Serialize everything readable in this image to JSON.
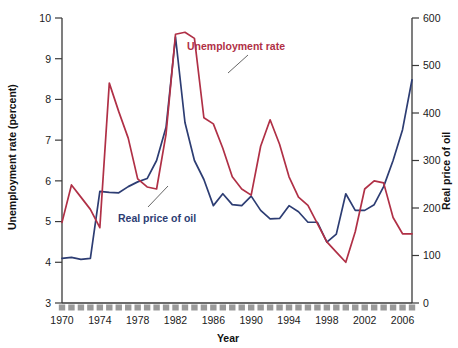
{
  "chart_data": {
    "type": "line",
    "title": "",
    "xlabel": "Year",
    "ylabel": "Unemployment rate (percent)",
    "y2label": "Real price of oil",
    "ylim": [
      3,
      10
    ],
    "y2lim": [
      0,
      600
    ],
    "xlim": [
      1970,
      2007
    ],
    "grid": false,
    "legend_position": "inline-annotations",
    "x_tick_labels": [
      "1970",
      "1974",
      "1978",
      "1982",
      "1986",
      "1990",
      "1994",
      "1998",
      "2002",
      "2006"
    ],
    "x_tick_values": [
      1970,
      1974,
      1978,
      1982,
      1986,
      1990,
      1994,
      1998,
      2002,
      2006
    ],
    "x_minor_ticks_every": 1,
    "y_tick_labels": [
      "3",
      "4",
      "5",
      "6",
      "7",
      "8",
      "9",
      "10"
    ],
    "y_tick_values": [
      3,
      4,
      5,
      6,
      7,
      8,
      9,
      10
    ],
    "y2_tick_labels": [
      "0",
      "100",
      "200",
      "300",
      "400",
      "500",
      "600"
    ],
    "y2_tick_values": [
      0,
      100,
      200,
      300,
      400,
      500,
      600
    ],
    "x": [
      1970,
      1971,
      1972,
      1973,
      1974,
      1975,
      1976,
      1977,
      1978,
      1979,
      1980,
      1981,
      1982,
      1983,
      1984,
      1985,
      1986,
      1987,
      1988,
      1989,
      1990,
      1991,
      1992,
      1993,
      1994,
      1995,
      1996,
      1997,
      1998,
      1999,
      2000,
      2001,
      2002,
      2003,
      2004,
      2005,
      2006,
      2007
    ],
    "series": [
      {
        "name": "Unemployment rate",
        "axis": "left",
        "color": "#b03046",
        "units": "percent",
        "values": [
          4.98,
          5.9,
          5.6,
          5.3,
          4.85,
          8.4,
          7.7,
          7.05,
          6.05,
          5.85,
          5.8,
          7.15,
          9.6,
          9.65,
          9.5,
          7.55,
          7.4,
          6.8,
          6.1,
          5.8,
          5.65,
          6.85,
          7.5,
          6.9,
          6.1,
          5.6,
          5.4,
          4.95,
          4.5,
          4.25,
          4.0,
          4.75,
          5.8,
          6.0,
          5.95,
          5.1,
          4.7,
          4.7
        ]
      },
      {
        "name": "Real price of oil",
        "axis": "right",
        "color": "#2d3d73",
        "units": "index",
        "values": [
          94,
          96,
          92,
          94,
          235,
          233,
          232,
          245,
          255,
          262,
          300,
          370,
          560,
          380,
          300,
          260,
          205,
          230,
          207,
          205,
          225,
          195,
          177,
          178,
          205,
          192,
          170,
          170,
          128,
          145,
          230,
          195,
          195,
          207,
          245,
          300,
          365,
          470
        ]
      }
    ],
    "annotations": [
      {
        "name": "unemployment-rate-label",
        "text": "Unemployment rate",
        "color": "#b03046"
      },
      {
        "name": "real-price-of-oil-label",
        "text": "Real price of oil",
        "color": "#2d3d73"
      }
    ]
  }
}
